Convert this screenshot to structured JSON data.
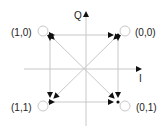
{
  "diagram": {
    "type": "constellation",
    "axes": {
      "horizontal_label": "I",
      "vertical_label": "Q"
    },
    "points": [
      {
        "label": "(1,0)",
        "quadrant": "top-left"
      },
      {
        "label": "(0,0)",
        "quadrant": "top-right"
      },
      {
        "label": "(1,1)",
        "quadrant": "bottom-left"
      },
      {
        "label": "(0,1)",
        "quadrant": "bottom-right"
      }
    ],
    "colors": {
      "axis": "#c8c8c8",
      "arrow": "#111111",
      "text": "#222222"
    }
  }
}
